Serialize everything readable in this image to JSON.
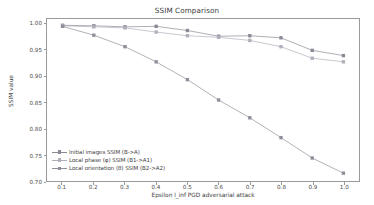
{
  "chart_data": {
    "type": "line",
    "title": "SSIM Comparison",
    "xlabel": "Epsilon l_inf PGD adversarial attack",
    "ylabel": "SSIM value",
    "x": [
      0.1,
      0.2,
      0.3,
      0.4,
      0.5,
      0.6,
      0.7,
      0.8,
      0.9,
      1.0
    ],
    "xlim": [
      0.05,
      1.05
    ],
    "ylim": [
      0.7,
      1.01
    ],
    "xticks": [
      "0.1",
      "0.2",
      "0.3",
      "0.4",
      "0.5",
      "0.6",
      "0.7",
      "0.8",
      "0.9",
      "1.0"
    ],
    "yticks": [
      "0.70",
      "0.75",
      "0.80",
      "0.85",
      "0.90",
      "0.95",
      "1.00"
    ],
    "ytick_values": [
      0.7,
      0.75,
      0.8,
      0.85,
      0.9,
      0.95,
      1.0
    ],
    "grid": false,
    "legend_position": "lower left",
    "series": [
      {
        "name": "Initial images SSIM (B->A)",
        "color": "#8a8a96",
        "marker": "square",
        "values": [
          0.998,
          0.997,
          0.995,
          0.996,
          0.988,
          0.977,
          0.978,
          0.974,
          0.95,
          0.94
        ]
      },
      {
        "name": "Local phase (φ) SSIM (B1->A1)",
        "color": "#b0b0bb",
        "marker": "square",
        "values": [
          0.997,
          0.995,
          0.993,
          0.985,
          0.978,
          0.975,
          0.969,
          0.957,
          0.935,
          0.928
        ]
      },
      {
        "name": "Local orientation (θ) SSIM (B2->A2)",
        "color": "#8f8f9a",
        "marker": "square",
        "values": [
          0.996,
          0.979,
          0.957,
          0.928,
          0.894,
          0.855,
          0.821,
          0.783,
          0.744,
          0.715
        ]
      }
    ]
  }
}
